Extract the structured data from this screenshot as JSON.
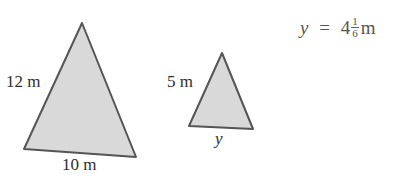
{
  "diagram": {
    "large_triangle": {
      "side_label": "12 m",
      "base_label": "10 m",
      "fill": "#d9d9d9",
      "stroke": "#555555"
    },
    "small_triangle": {
      "side_label": "5 m",
      "base_label": "y",
      "fill": "#d9d9d9",
      "stroke": "#555555"
    },
    "answer": {
      "variable": "y",
      "equals": "=",
      "whole": "4",
      "numerator": "1",
      "denominator": "6",
      "unit": "m"
    }
  }
}
